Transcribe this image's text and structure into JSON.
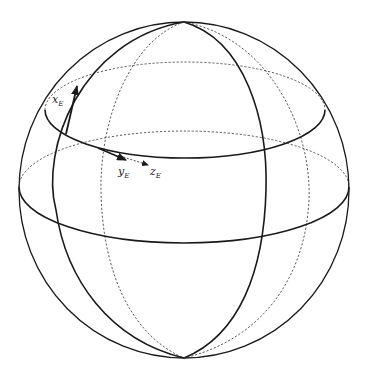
{
  "diagram": {
    "stroke_color": "#1a1a1a",
    "background": "#ffffff",
    "sphere": {
      "cx": 184,
      "cy": 190,
      "rx": 165,
      "ry": 168
    },
    "latitudes": [
      {
        "name": "upper-latitude",
        "cx": 185,
        "cy": 109,
        "rx": 140,
        "ry": 48
      },
      {
        "name": "equator",
        "cx": 184,
        "cy": 187,
        "rx": 165,
        "ry": 56
      }
    ],
    "meridians": [
      {
        "name": "front-meridian",
        "cx": 160,
        "cy": 190,
        "rx": 105,
        "ry": 168
      },
      {
        "name": "back-meridian",
        "cx": 205,
        "cy": 190,
        "rx": 104,
        "ry": 168
      }
    ],
    "axes": [
      {
        "id": "x",
        "label": "x",
        "subscript": "E",
        "style": "solid-thick"
      },
      {
        "id": "y",
        "label": "y",
        "subscript": "E",
        "style": "solid-thick"
      },
      {
        "id": "z",
        "label": "z",
        "subscript": "E",
        "style": "dashed"
      }
    ]
  }
}
